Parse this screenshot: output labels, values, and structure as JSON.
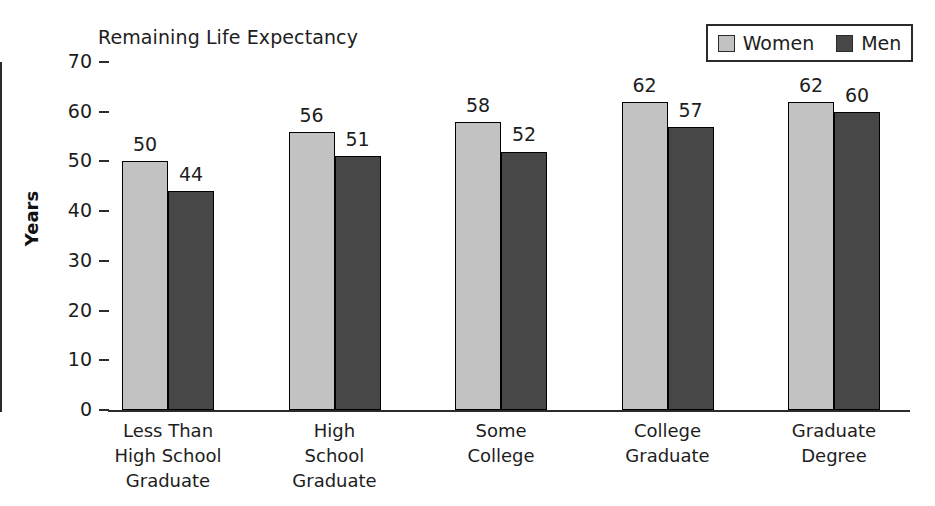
{
  "chart_data": {
    "type": "bar",
    "title": "Remaining Life Expectancy",
    "xlabel": "",
    "ylabel": "Years",
    "ylim": [
      0,
      70
    ],
    "yticks": [
      0,
      10,
      20,
      30,
      40,
      50,
      60,
      70
    ],
    "ytick_labels": [
      "0",
      "10",
      "20",
      "30",
      "40",
      "50",
      "60",
      "70"
    ],
    "grid": false,
    "legend_position": "top-right",
    "categories": [
      "Less Than\nHigh School\nGraduate",
      "High\nSchool\nGraduate",
      "Some\nCollege",
      "College\nGraduate",
      "Graduate\nDegree"
    ],
    "series": [
      {
        "name": "Women",
        "color": "#c2c2c2",
        "values": [
          50,
          56,
          58,
          62,
          62
        ],
        "value_labels": [
          "50",
          "56",
          "58",
          "62",
          "62"
        ]
      },
      {
        "name": "Men",
        "color": "#474747",
        "values": [
          44,
          51,
          52,
          57,
          60
        ],
        "value_labels": [
          "44",
          "51",
          "52",
          "57",
          "60"
        ]
      }
    ]
  },
  "legend": {
    "entries": [
      {
        "label": "Women",
        "color": "#c2c2c2"
      },
      {
        "label": "Men",
        "color": "#474747"
      }
    ]
  },
  "axis": {
    "y_title": "Years",
    "ticks": [
      "70",
      "60",
      "50",
      "40",
      "30",
      "20",
      "10",
      "0"
    ]
  }
}
